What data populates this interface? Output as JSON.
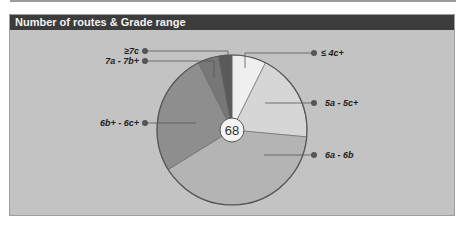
{
  "header": {
    "title": "Number of routes & Grade range"
  },
  "center_label": "68",
  "chart_data": {
    "type": "pie",
    "title": "Number of routes & Grade range",
    "total": 68,
    "categories": [
      "≤ 4c+",
      "5a - 5c+",
      "6a - 6b",
      "6b+ - 6c+",
      "7a - 7b+",
      "≥7c"
    ],
    "values": [
      5,
      13,
      27,
      18,
      3,
      2
    ],
    "colors": [
      "#efefef",
      "#d6d6d6",
      "#b4b4b4",
      "#8e8e8e",
      "#777777",
      "#5a5a5a"
    ],
    "legend_position": "callouts"
  },
  "labels": {
    "l0": "≤ 4c+",
    "l1": "5a - 5c+",
    "l2": "6a - 6b",
    "l3": "6b+ - 6c+",
    "l4": "7a - 7b+",
    "l5": "≥7c"
  }
}
